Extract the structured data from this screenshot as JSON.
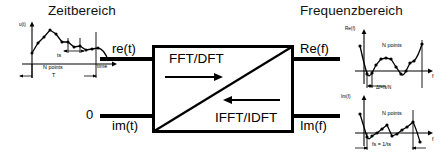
{
  "diagram": {
    "headings": {
      "time_domain": "Zeitbereich",
      "frequency_domain": "Frequenzbereich"
    },
    "center_block": {
      "forward_label": "FFT/DFT",
      "inverse_label": "IFFT/IDFT"
    },
    "inputs": [
      {
        "id": "re-t",
        "label": "re(t)"
      },
      {
        "id": "im-t",
        "label": "im(t)"
      }
    ],
    "zero_label": "0",
    "outputs": [
      {
        "id": "re-f",
        "label": "Re(f)"
      },
      {
        "id": "im-f",
        "label": "Im(f)"
      }
    ],
    "time_plot": {
      "y_axis_label": "u(t)",
      "x_axis_label": "time",
      "points_label": "N points",
      "period_label": "T",
      "sample_label": "ts"
    },
    "freq_plot_real": {
      "y_axis_label": "Re(f)",
      "x_axis_label": "f",
      "points_label": "N points",
      "resolution_label": "Δf=fs/N"
    },
    "freq_plot_imag": {
      "y_axis_label": "Im(f)",
      "x_axis_label": "f",
      "points_label": "N points",
      "sampling_label": "fs = 1/ts"
    },
    "colors": {
      "ink": "#000000",
      "background": "#ffffff"
    }
  }
}
